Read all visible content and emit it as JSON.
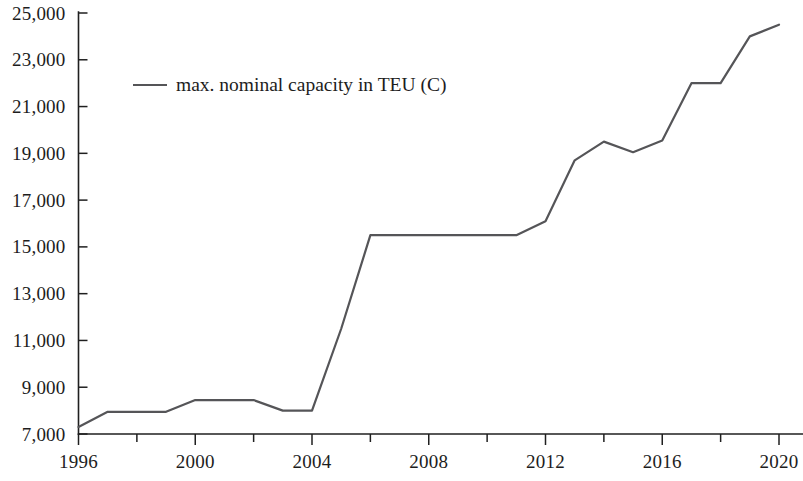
{
  "chart_data": {
    "type": "line",
    "title": "",
    "subtitle": "",
    "xlabel": "",
    "ylabel": "",
    "xlim": [
      1996,
      2020
    ],
    "ylim": [
      7000,
      25000
    ],
    "grid": false,
    "legend_position": "top-left",
    "y_ticks": [
      7000,
      9000,
      11000,
      13000,
      15000,
      17000,
      19000,
      21000,
      23000,
      25000
    ],
    "y_tick_labels": [
      "7,000",
      "9,000",
      "11,000",
      "13,000",
      "15,000",
      "17,000",
      "19,000",
      "21,000",
      "23,000",
      "25,000"
    ],
    "x_ticks": [
      1996,
      1998,
      2000,
      2002,
      2004,
      2006,
      2008,
      2010,
      2012,
      2014,
      2016,
      2018,
      2020
    ],
    "x_tick_labels_shown": [
      "1996",
      "2000",
      "2004",
      "2008",
      "2012",
      "2016",
      "2020"
    ],
    "x_labeled_ticks": [
      1996,
      2000,
      2004,
      2008,
      2012,
      2016,
      2020
    ],
    "series": [
      {
        "name": "max. nominal capacity in TEU (C)",
        "color": "#555558",
        "x": [
          1996,
          1997,
          1998,
          1999,
          2000,
          2001,
          2002,
          2003,
          2004,
          2005,
          2006,
          2007,
          2008,
          2009,
          2010,
          2011,
          2012,
          2013,
          2014,
          2015,
          2016,
          2017,
          2018,
          2019,
          2020
        ],
        "values": [
          7300,
          7950,
          7950,
          7950,
          8450,
          8450,
          8450,
          8000,
          8000,
          11500,
          15500,
          15500,
          15500,
          15500,
          15500,
          15500,
          16100,
          18700,
          19500,
          19050,
          19550,
          22000,
          22000,
          24000,
          24500
        ]
      }
    ]
  },
  "legend": {
    "entries": [
      {
        "label": "max. nominal capacity in TEU (C)",
        "color": "#555558"
      }
    ]
  },
  "axes": {
    "y_axis_name": "capacity-axis",
    "x_axis_name": "year-axis"
  }
}
